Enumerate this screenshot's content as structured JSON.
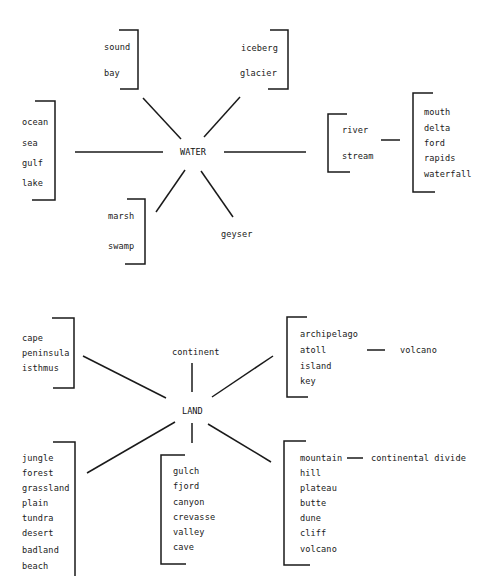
{
  "diagram": {
    "type": "concept-map",
    "water": {
      "hub": "WATER",
      "groups": {
        "upper_left": [
          "sound",
          "bay"
        ],
        "upper_right": [
          "iceberg",
          "glacier"
        ],
        "left": [
          "ocean",
          "sea",
          "gulf",
          "lake"
        ],
        "right": [
          "river",
          "stream"
        ],
        "right_sub": [
          "mouth",
          "delta",
          "ford",
          "rapids",
          "waterfall"
        ],
        "lower_left": [
          "marsh",
          "swamp"
        ],
        "lower_right": "geyser"
      }
    },
    "land": {
      "hub": "LAND",
      "groups": {
        "upper_left": [
          "cape",
          "peninsula",
          "isthmus"
        ],
        "top": "continent",
        "upper_right": [
          "archipelago",
          "atoll",
          "island",
          "key"
        ],
        "upper_right_sub": "volcano",
        "lower_left": [
          "jungle",
          "forest",
          "grassland",
          "plain",
          "tundra",
          "desert",
          "badland",
          "beach"
        ],
        "bottom": [
          "gulch",
          "fjord",
          "canyon",
          "crevasse",
          "valley",
          "cave"
        ],
        "lower_right": [
          "mountain",
          "hill",
          "plateau",
          "butte",
          "dune",
          "cliff",
          "volcano"
        ],
        "lower_right_sub": "continental divide"
      }
    },
    "colors": {
      "ink": "#1a1a1a",
      "background": "#ffffff"
    }
  }
}
